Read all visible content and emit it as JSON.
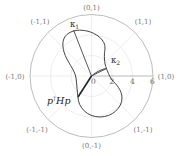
{
  "diagram": {
    "type": "polar-plot",
    "center_px": [
      91.5,
      76
    ],
    "px_per_unit": 10.2,
    "rings": [
      2,
      4,
      6
    ],
    "radial_ticks": [
      {
        "value": "0",
        "x": 93.5,
        "y": 84
      },
      {
        "value": "2",
        "x": 112,
        "y": 84
      },
      {
        "value": "4",
        "x": 132.5,
        "y": 84
      },
      {
        "value": "6",
        "x": 152.5,
        "y": 84
      }
    ],
    "direction_labels": [
      {
        "text": "(0,1)",
        "x": 91.5,
        "y": 10
      },
      {
        "text": "(1,1)",
        "x": 143,
        "y": 24
      },
      {
        "text": "(1,0)",
        "x": 165,
        "y": 79
      },
      {
        "text": "(1,-1)",
        "x": 143,
        "y": 133
      },
      {
        "text": "(0,-1)",
        "x": 91.5,
        "y": 149
      },
      {
        "text": "(-1,-1)",
        "x": 38,
        "y": 133
      },
      {
        "text": "(-1,0)",
        "x": 16,
        "y": 79
      },
      {
        "text": "(-1,1)",
        "x": 40,
        "y": 24
      }
    ],
    "annotations": {
      "kappa1": "κ",
      "kappa1_sub": "1",
      "kappa2": "κ",
      "kappa2_sub": "2",
      "curvature_label_main": "p",
      "curvature_label_sup": "⊺",
      "curvature_label_rest": "Hp"
    },
    "colors": {
      "grid": "#e6e6e6",
      "outer_circle": "#bdbdbd",
      "curve": "#444444",
      "thick_line": "#222222",
      "axis_line": "#9a9a9a"
    }
  }
}
